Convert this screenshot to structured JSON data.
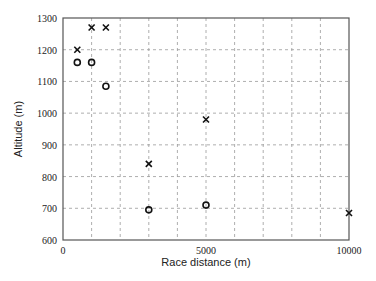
{
  "chart_data": {
    "type": "scatter",
    "title": "",
    "xlabel": "Race distance (m)",
    "ylabel": "Altitude (m)",
    "xlim": [
      0,
      10000
    ],
    "ylim": [
      600,
      1300
    ],
    "x_ticks": [
      0,
      5000,
      10000
    ],
    "x_tick_labels": [
      "0",
      "5000",
      "10000"
    ],
    "x_grid_step": 1000,
    "y_ticks": [
      600,
      700,
      800,
      900,
      1000,
      1100,
      1200,
      1300
    ],
    "y_tick_labels": [
      "600",
      "700",
      "800",
      "900",
      "1000",
      "1100",
      "1200",
      "1300"
    ],
    "grid": true,
    "grid_style": "dashed",
    "legend": null,
    "series": [
      {
        "name": "cross",
        "marker": "x",
        "points": [
          {
            "x": 500,
            "y": 1200
          },
          {
            "x": 1000,
            "y": 1270
          },
          {
            "x": 1500,
            "y": 1270
          },
          {
            "x": 3000,
            "y": 840
          },
          {
            "x": 5000,
            "y": 980
          },
          {
            "x": 10000,
            "y": 685
          }
        ]
      },
      {
        "name": "circle",
        "marker": "o",
        "points": [
          {
            "x": 500,
            "y": 1160
          },
          {
            "x": 1000,
            "y": 1160
          },
          {
            "x": 1500,
            "y": 1085
          },
          {
            "x": 3000,
            "y": 695
          },
          {
            "x": 5000,
            "y": 710
          }
        ]
      }
    ]
  },
  "colors": {
    "axis": "#555555",
    "grid": "#999999",
    "marker": "#111111",
    "text": "#222222"
  }
}
